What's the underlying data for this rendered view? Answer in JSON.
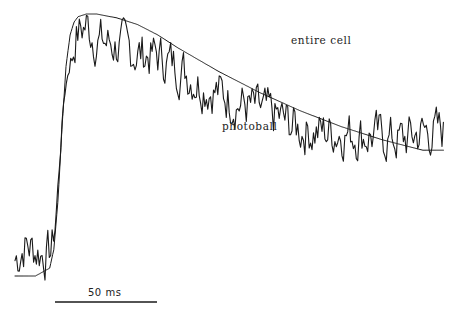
{
  "chart_data": {
    "type": "line",
    "title": "",
    "xlabel": "",
    "ylabel": "",
    "grid": false,
    "axes_visible": false,
    "legend": "inline labels",
    "scale_bar": {
      "label": "50 ms",
      "value_ms": 50
    },
    "x_units": "ms",
    "y_units": "normalized fluorescence (arbitrary)",
    "series": [
      {
        "name": "entire cell",
        "style": "smooth thin line",
        "x_ms": [
          0,
          10,
          17,
          19,
          21,
          23,
          25,
          27,
          29,
          31,
          35,
          40,
          50,
          60,
          70,
          80,
          100,
          120,
          140,
          160,
          180,
          200
        ],
        "y": [
          0.0,
          0.0,
          0.03,
          0.1,
          0.28,
          0.56,
          0.8,
          0.92,
          0.97,
          0.99,
          1.0,
          1.0,
          0.985,
          0.96,
          0.92,
          0.87,
          0.78,
          0.7,
          0.63,
          0.57,
          0.52,
          0.48
        ]
      },
      {
        "name": "photoball",
        "style": "noisy line",
        "x_ms": [
          0,
          5,
          10,
          15,
          18,
          20,
          22,
          24,
          26,
          28,
          30,
          35,
          40,
          50,
          60,
          70,
          80,
          90,
          100,
          110,
          120,
          130,
          140,
          150,
          160,
          170,
          180,
          190,
          200
        ],
        "y": [
          0.06,
          0.12,
          0.1,
          0.08,
          0.1,
          0.22,
          0.45,
          0.68,
          0.78,
          0.84,
          0.92,
          0.96,
          0.9,
          0.88,
          0.85,
          0.84,
          0.8,
          0.74,
          0.7,
          0.66,
          0.63,
          0.6,
          0.56,
          0.55,
          0.55,
          0.54,
          0.53,
          0.52,
          0.55
        ]
      }
    ],
    "annotations": [
      {
        "text": "entire cell",
        "near_series": "entire cell"
      },
      {
        "text": "photoball",
        "near_series": "photoball"
      }
    ]
  },
  "labels": {
    "entire_cell": "entire cell",
    "photoball": "photoball",
    "scale_bar": "50 ms"
  },
  "colors": {
    "trace": "#1a1a1a",
    "background": "#ffffff"
  }
}
